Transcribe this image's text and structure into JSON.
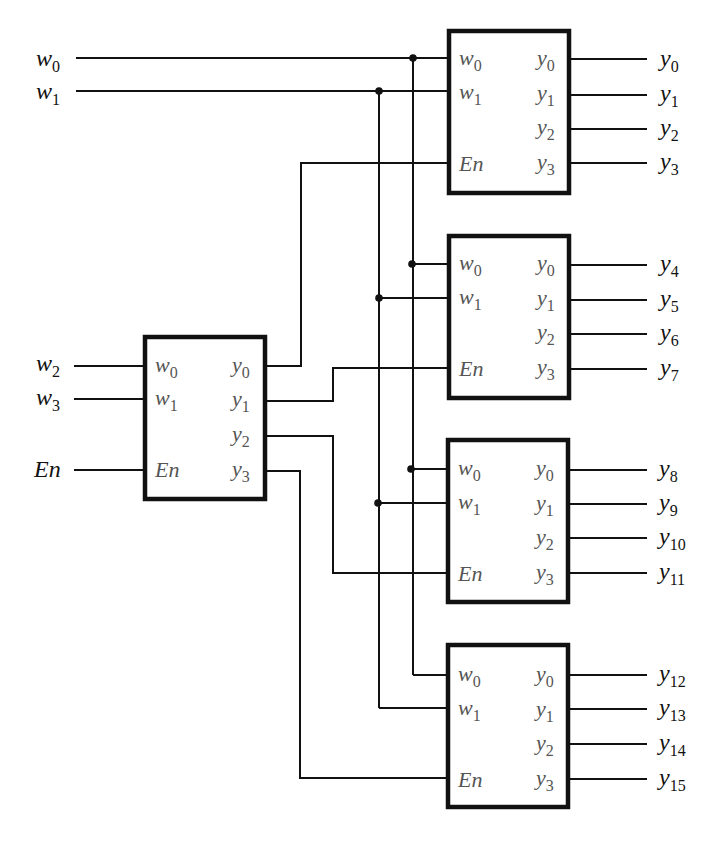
{
  "diagram": {
    "colors": {
      "line": "#111111",
      "internal_label": "#555555",
      "background": "#ffffff"
    },
    "inputs": {
      "w0": {
        "base": "w",
        "sub": "0"
      },
      "w1": {
        "base": "w",
        "sub": "1"
      },
      "w2": {
        "base": "w",
        "sub": "2"
      },
      "w3": {
        "base": "w",
        "sub": "3"
      },
      "en": {
        "base": "En"
      }
    },
    "decoder_ports": {
      "in0": {
        "base": "w",
        "sub": "0"
      },
      "in1": {
        "base": "w",
        "sub": "1"
      },
      "en": "En",
      "out0": {
        "base": "y",
        "sub": "0"
      },
      "out1": {
        "base": "y",
        "sub": "1"
      },
      "out2": {
        "base": "y",
        "sub": "2"
      },
      "out3": {
        "base": "y",
        "sub": "3"
      }
    },
    "outputs": [
      {
        "base": "y",
        "sub": "0"
      },
      {
        "base": "y",
        "sub": "1"
      },
      {
        "base": "y",
        "sub": "2"
      },
      {
        "base": "y",
        "sub": "3"
      },
      {
        "base": "y",
        "sub": "4"
      },
      {
        "base": "y",
        "sub": "5"
      },
      {
        "base": "y",
        "sub": "6"
      },
      {
        "base": "y",
        "sub": "7"
      },
      {
        "base": "y",
        "sub": "8"
      },
      {
        "base": "y",
        "sub": "9"
      },
      {
        "base": "y",
        "sub": "10"
      },
      {
        "base": "y",
        "sub": "11"
      },
      {
        "base": "y",
        "sub": "12"
      },
      {
        "base": "y",
        "sub": "13"
      },
      {
        "base": "y",
        "sub": "14"
      },
      {
        "base": "y",
        "sub": "15"
      }
    ],
    "decoders": [
      {
        "id": "selector",
        "inputs": [
          "w2",
          "w3"
        ],
        "enable": "En",
        "outputs_drive": [
          "dec0.En",
          "dec1.En",
          "dec2.En",
          "dec3.En"
        ]
      },
      {
        "id": "dec0",
        "inputs": [
          "w0",
          "w1"
        ],
        "outputs": [
          "y0",
          "y1",
          "y2",
          "y3"
        ]
      },
      {
        "id": "dec1",
        "inputs": [
          "w0",
          "w1"
        ],
        "outputs": [
          "y4",
          "y5",
          "y6",
          "y7"
        ]
      },
      {
        "id": "dec2",
        "inputs": [
          "w0",
          "w1"
        ],
        "outputs": [
          "y8",
          "y9",
          "y10",
          "y11"
        ]
      },
      {
        "id": "dec3",
        "inputs": [
          "w0",
          "w1"
        ],
        "outputs": [
          "y12",
          "y13",
          "y14",
          "y15"
        ]
      }
    ]
  }
}
